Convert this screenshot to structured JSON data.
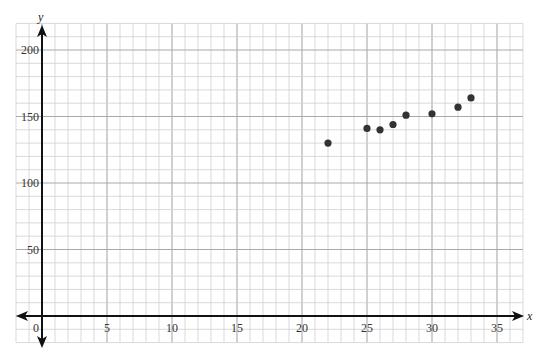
{
  "chart_data": {
    "type": "scatter",
    "title": "",
    "xlabel": "x",
    "ylabel": "y",
    "xlim": [
      -2,
      37
    ],
    "ylim": [
      -20,
      220
    ],
    "grid": true,
    "x_ticks": [
      0,
      5,
      10,
      15,
      20,
      25,
      30,
      35
    ],
    "y_ticks": [
      50,
      100,
      150,
      200
    ],
    "x_tick_labels": [
      "0",
      "5",
      "10",
      "15",
      "20",
      "25",
      "30",
      "35"
    ],
    "y_tick_labels": [
      "50",
      "100",
      "150",
      "200"
    ],
    "series": [
      {
        "name": "data",
        "color": "#333333",
        "points": [
          {
            "x": 22,
            "y": 130
          },
          {
            "x": 25,
            "y": 141
          },
          {
            "x": 26,
            "y": 140
          },
          {
            "x": 27,
            "y": 144
          },
          {
            "x": 28,
            "y": 151
          },
          {
            "x": 30,
            "y": 152
          },
          {
            "x": 32,
            "y": 157
          },
          {
            "x": 33,
            "y": 164
          }
        ]
      }
    ]
  },
  "colors": {
    "grid_minor": "#cfcfcf",
    "grid_major": "#a9a9a9",
    "axis": "#111111",
    "point": "#333333"
  }
}
